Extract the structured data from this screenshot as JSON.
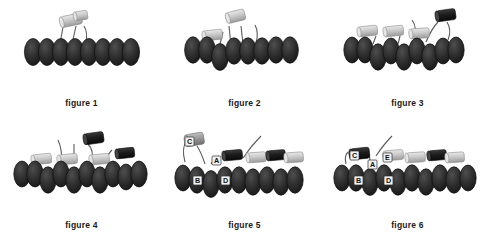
{
  "page": {
    "background_color": "#ffffff",
    "width": 489,
    "height": 244,
    "layout": "2 rows x 3 columns of figure panels"
  },
  "palette": {
    "bead_dark": "#2b2b2b",
    "bead_dark_edge": "#161616",
    "bead_highlight": "#4a4a4a",
    "cylinder_light": "#c9c9c9",
    "cylinder_light_edge": "#8d8d8d",
    "cylinder_light_end": "#e6e6e6",
    "cylinder_dark": "#1d1d1d",
    "cylinder_dark_edge": "#0c0c0c",
    "cylinder_mid": "#9b9b9b",
    "linker_line": "#5a5a5a",
    "label_box_fill": "#f2f2f2",
    "label_box_stroke": "#2b2b2b",
    "label_text": "#111111",
    "caption_text": "#1a1a1a"
  },
  "panels": [
    {
      "id": "figure-1",
      "caption": "figure 1",
      "bead_count": 8,
      "bead_rows": 1,
      "cylinders": [
        {
          "shade": "light",
          "x": 62,
          "y": 20,
          "w": 20,
          "h": 11,
          "rot": -12
        },
        {
          "shade": "light",
          "x": 74,
          "y": 16,
          "w": 12,
          "h": 9,
          "rot": -8
        }
      ],
      "linkers": 3,
      "labels": []
    },
    {
      "id": "figure-2",
      "caption": "figure 2",
      "bead_count": 8,
      "bead_rows": 2,
      "cylinders": [
        {
          "shade": "light",
          "x": 38,
          "y": 32,
          "w": 18,
          "h": 10,
          "rot": -6
        },
        {
          "shade": "light",
          "x": 64,
          "y": 14,
          "w": 17,
          "h": 11,
          "rot": -14
        }
      ],
      "linkers": 4,
      "labels": []
    },
    {
      "id": "figure-3",
      "caption": "figure 3",
      "bead_count": 9,
      "bead_rows": 2,
      "cylinders": [
        {
          "shade": "light",
          "x": 30,
          "y": 28,
          "w": 18,
          "h": 10,
          "rot": -6
        },
        {
          "shade": "light",
          "x": 56,
          "y": 28,
          "w": 18,
          "h": 10,
          "rot": -6
        },
        {
          "shade": "light",
          "x": 80,
          "y": 30,
          "w": 18,
          "h": 10,
          "rot": -4
        },
        {
          "shade": "dark",
          "x": 104,
          "y": 12,
          "w": 18,
          "h": 11,
          "rot": -8
        }
      ],
      "linkers": 5,
      "labels": []
    },
    {
      "id": "figure-4",
      "caption": "figure 4",
      "bead_count": 10,
      "bead_rows": 2,
      "cylinders": [
        {
          "shade": "light",
          "x": 30,
          "y": 34,
          "w": 18,
          "h": 10,
          "rot": -6
        },
        {
          "shade": "light",
          "x": 56,
          "y": 34,
          "w": 18,
          "h": 10,
          "rot": -5
        },
        {
          "shade": "dark",
          "x": 82,
          "y": 14,
          "w": 18,
          "h": 11,
          "rot": -8
        },
        {
          "shade": "light",
          "x": 90,
          "y": 34,
          "w": 18,
          "h": 10,
          "rot": -5
        },
        {
          "shade": "dark",
          "x": 116,
          "y": 28,
          "w": 17,
          "h": 10,
          "rot": -6
        }
      ],
      "linkers": 5,
      "labels": []
    },
    {
      "id": "figure-5",
      "caption": "figure 5",
      "bead_count": 9,
      "bead_rows": 2,
      "cylinders": [
        {
          "shade": "mid",
          "x": 22,
          "y": 14,
          "w": 17,
          "h": 12,
          "rot": -10
        },
        {
          "shade": "dark",
          "x": 60,
          "y": 30,
          "w": 18,
          "h": 10,
          "rot": -5
        },
        {
          "shade": "light",
          "x": 84,
          "y": 32,
          "w": 18,
          "h": 10,
          "rot": -4
        },
        {
          "shade": "dark",
          "x": 104,
          "y": 30,
          "w": 17,
          "h": 10,
          "rot": -5
        },
        {
          "shade": "light",
          "x": 120,
          "y": 32,
          "w": 17,
          "h": 10,
          "rot": -4
        }
      ],
      "linkers": 4,
      "labels": [
        {
          "text": "C",
          "x": 26,
          "y": 20
        },
        {
          "text": "A",
          "x": 53,
          "y": 40
        },
        {
          "text": "B",
          "x": 35,
          "y": 62
        },
        {
          "text": "D",
          "x": 66,
          "y": 62
        }
      ]
    },
    {
      "id": "figure-6",
      "caption": "figure 6",
      "bead_count": 10,
      "bead_rows": 2,
      "cylinders": [
        {
          "shade": "dark",
          "x": 24,
          "y": 28,
          "w": 18,
          "h": 11,
          "rot": -6
        },
        {
          "shade": "light",
          "x": 58,
          "y": 30,
          "w": 18,
          "h": 10,
          "rot": -5
        },
        {
          "shade": "light",
          "x": 80,
          "y": 32,
          "w": 18,
          "h": 10,
          "rot": -4
        },
        {
          "shade": "dark",
          "x": 102,
          "y": 30,
          "w": 17,
          "h": 10,
          "rot": -5
        },
        {
          "shade": "light",
          "x": 120,
          "y": 32,
          "w": 17,
          "h": 10,
          "rot": -4
        }
      ],
      "linkers": 3,
      "labels": [
        {
          "text": "C",
          "x": 28,
          "y": 34
        },
        {
          "text": "A",
          "x": 46,
          "y": 44
        },
        {
          "text": "E",
          "x": 61,
          "y": 36
        },
        {
          "text": "B",
          "x": 33,
          "y": 62
        },
        {
          "text": "D",
          "x": 66,
          "y": 62
        }
      ]
    }
  ]
}
